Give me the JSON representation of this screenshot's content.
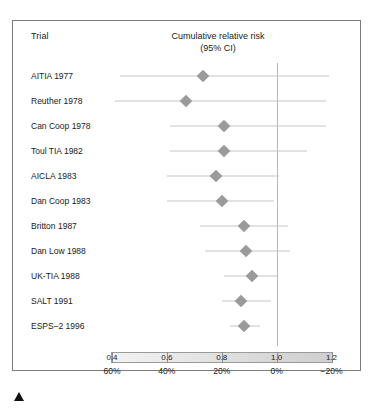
{
  "figure": {
    "column_header_trial": "Trial",
    "column_header_risk_line1": "Cumulative relative risk",
    "column_header_risk_line2": "(95% CI)",
    "marker_icon": "up-triangle-icon",
    "colors": {
      "frame": "#7b7b7b",
      "point": "#9a9a9a",
      "ci_line": "#c6c6c6",
      "null_line": "#b9b9b9",
      "text": "#1a1a1a"
    }
  },
  "chart_data": {
    "type": "scatter",
    "title": "Cumulative relative risk (95% CI)",
    "xlabel": "",
    "ylabel": "Trial",
    "xlim": [
      0.32,
      1.27
    ],
    "grid": false,
    "legend": "none",
    "null_value": 1.0,
    "x_axis_primary": {
      "label": "Cumulative relative risk",
      "ticks": [
        0.4,
        0.6,
        0.8,
        1.0,
        1.2
      ],
      "tick_labels": [
        "0.4",
        "0.6",
        "0.8",
        "1.0",
        "1.2"
      ]
    },
    "x_axis_secondary": {
      "label": "Risk reduction",
      "ticks": [
        0.4,
        0.6,
        0.8,
        1.0,
        1.2
      ],
      "tick_labels": [
        "60%",
        "40%",
        "20%",
        "0%",
        "−20%"
      ]
    },
    "categories": [
      "AITIA 1977",
      "Reuther 1978",
      "Can Coop 1978",
      "Toul TIA 1982",
      "AICLA 1983",
      "Dan Coop 1983",
      "Britton 1987",
      "Dan Low 1988",
      "UK-TIA 1988",
      "SALT 1991",
      "ESPS–2 1996"
    ],
    "points": [
      {
        "trial": "AITIA 1977",
        "value": 0.73,
        "ci_low": 0.43,
        "ci_high": 1.19
      },
      {
        "trial": "Reuther 1978",
        "value": 0.67,
        "ci_low": 0.41,
        "ci_high": 1.18
      },
      {
        "trial": "Can Coop 1978",
        "value": 0.81,
        "ci_low": 0.61,
        "ci_high": 1.18
      },
      {
        "trial": "Toul TIA 1982",
        "value": 0.81,
        "ci_low": 0.61,
        "ci_high": 1.11
      },
      {
        "trial": "AICLA 1983",
        "value": 0.78,
        "ci_low": 0.6,
        "ci_high": 1.01
      },
      {
        "trial": "Dan Coop 1983",
        "value": 0.8,
        "ci_low": 0.6,
        "ci_high": 0.99
      },
      {
        "trial": "Britton 1987",
        "value": 0.88,
        "ci_low": 0.72,
        "ci_high": 1.04
      },
      {
        "trial": "Dan Low 1988",
        "value": 0.89,
        "ci_low": 0.74,
        "ci_high": 1.05
      },
      {
        "trial": "UK-TIA 1988",
        "value": 0.91,
        "ci_low": 0.81,
        "ci_high": 1.0
      },
      {
        "trial": "SALT 1991",
        "value": 0.87,
        "ci_low": 0.8,
        "ci_high": 0.98
      },
      {
        "trial": "ESPS–2 1996",
        "value": 0.88,
        "ci_low": 0.83,
        "ci_high": 0.94
      }
    ]
  }
}
